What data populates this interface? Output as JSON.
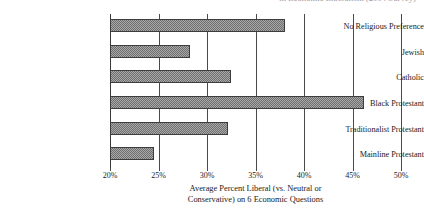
{
  "figure": {
    "top_clipped_fragment": "in Economic Liberalism (2004 Survey)"
  },
  "chart_data": {
    "type": "bar",
    "orientation": "horizontal",
    "title": "",
    "subtitle": "",
    "xlabel_line1": "Average Percent Liberal (vs. Neutral or",
    "xlabel_line2": "Conservative) on 6 Economic Questions",
    "ylabel": "",
    "categories": [
      "No Religious Preference",
      "Jewish",
      "Catholic",
      "Black Protestant",
      "Traditionalist Protestant",
      "Mainline Protestant"
    ],
    "values": [
      38.0,
      28.2,
      32.5,
      46.2,
      32.2,
      24.5
    ],
    "xlim": [
      20,
      50
    ],
    "xticks": [
      20,
      25,
      30,
      35,
      40,
      45,
      50
    ],
    "xtick_labels": [
      "20%",
      "25%",
      "30%",
      "35%",
      "40%",
      "45%",
      "50%"
    ],
    "grid": true,
    "legend": null,
    "bar_fill_color": "#a8a8a8",
    "bar_edge_color": "#3d3d3d",
    "gridline_color": "#4a4a4a",
    "background_color": "#ffffff"
  }
}
